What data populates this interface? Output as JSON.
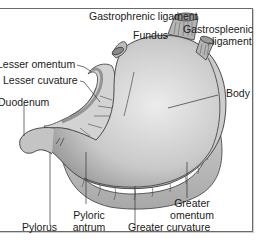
{
  "diagram": {
    "colors": {
      "stomach_light": "#e2e2e2",
      "stomach_dark": "#9c9c9c",
      "omentum": "#c4c4c4",
      "outline": "#3a3a3a",
      "frame": "#6a6a6a"
    },
    "labels": {
      "gastrophrenic_ligament": "Gastrophrenic ligament",
      "fundus": "Fundus",
      "gastrosplenic_ligament_1": "Gastrospleenic",
      "gastrosplenic_ligament_2": "ligament",
      "lesser_omentum": "Lesser omentum",
      "lesser_curvature": "Lesser cuvature",
      "duodenum": "Duodenum",
      "body": "Body",
      "pylorus": "Pylorus",
      "pyloric_antrum_1": "Pyloric",
      "pyloric_antrum_2": "antrum",
      "greater_curvature": "Greater curvature",
      "greater_omentum_1": "Greater",
      "greater_omentum_2": "omentum"
    }
  }
}
